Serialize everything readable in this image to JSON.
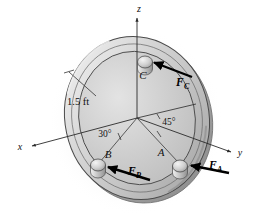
{
  "figure": {
    "axes": [
      {
        "name": "x-axis",
        "label": "x",
        "label_x": 20,
        "label_y": 150
      },
      {
        "name": "y-axis",
        "label": "y",
        "label_x": 237,
        "label_y": 155
      },
      {
        "name": "z-axis",
        "label": "z",
        "label_x": 138,
        "label_y": 12
      }
    ],
    "dimension": {
      "label": "1.5 ft",
      "label_x": 84,
      "label_y": 103,
      "leader_from_x": 96,
      "leader_from_y": 95,
      "leader_to_x": 68,
      "leader_to_y": 72
    },
    "angles": [
      {
        "name": "angle-30",
        "label": "30°",
        "label_x": 100,
        "label_y": 137
      },
      {
        "name": "angle-45",
        "label": "45°",
        "label_x": 162,
        "label_y": 126
      }
    ],
    "posts": [
      {
        "id": "C",
        "label": "C",
        "label_x": 143,
        "label_y": 79,
        "cx": 145,
        "cy": 62,
        "rx": 7.5,
        "ry": 6.0,
        "height": 7.0
      },
      {
        "id": "B",
        "label": "B",
        "label_x": 106,
        "label_y": 158,
        "cx": 98,
        "cy": 165,
        "rx": 7.5,
        "ry": 6.0,
        "height": 7.0
      },
      {
        "id": "A",
        "label": "A",
        "label_x": 160,
        "label_y": 156,
        "cx": 180,
        "cy": 166,
        "rx": 7.5,
        "ry": 6.0,
        "height": 7.0
      }
    ],
    "forces": [
      {
        "id": "FC",
        "letter": "F",
        "subscript": "C",
        "label_x": 176,
        "label_y": 82,
        "tail_x": 192,
        "tail_y": 77,
        "tip_x": 152,
        "tip_y": 62
      },
      {
        "id": "FB",
        "letter": "F",
        "subscript": "B",
        "label_x": 129,
        "label_y": 171,
        "tail_x": 150,
        "tail_y": 180,
        "tip_x": 106,
        "tip_y": 167
      },
      {
        "id": "FA",
        "letter": "F",
        "subscript": "A",
        "label_x": 210,
        "label_y": 165,
        "tail_x": 229,
        "tail_y": 173,
        "tip_x": 189,
        "tip_y": 165
      }
    ],
    "colors": {
      "plate_light": "#dcdcdc",
      "plate_mid": "#c9c9c9",
      "plate_dark": "#b2b2b2",
      "rim_highlight": "#ececec",
      "rim_shadow": "#9a9a9a",
      "outline": "#4a4a4a",
      "ink": "#111111",
      "background": "#ffffff",
      "shadow": "#e6e6e6"
    },
    "geometry": {
      "center_x": 137,
      "center_y": 118,
      "outer_rx": 72,
      "outer_ry": 82,
      "inner_rx": 58,
      "inner_ry": 67,
      "tilt_deg": -12
    }
  }
}
